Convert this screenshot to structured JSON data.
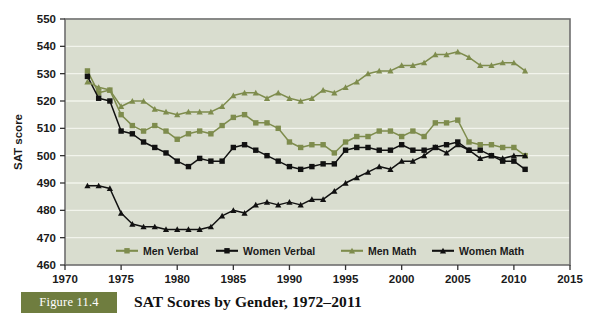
{
  "figure": {
    "badge_label": "Figure 11.4",
    "caption": "SAT Scores by Gender, 1972–2011"
  },
  "colors": {
    "plot_background": "#d9ddcf",
    "plot_border": "#6e6e6e",
    "gridline": "#f2f4ec",
    "men_series": "#7e8c4d",
    "women_series": "#111111",
    "badge_background": "#6f7d3f",
    "badge_text": "#ffffff",
    "text": "#1a1a1a"
  },
  "chart_data": {
    "type": "line",
    "title": "SAT Scores by Gender, 1972–2011",
    "xlabel": "",
    "ylabel": "SAT score",
    "xlim": [
      1970,
      2015
    ],
    "ylim": [
      460,
      550
    ],
    "xticks": [
      1970,
      1975,
      1980,
      1985,
      1990,
      1995,
      2000,
      2005,
      2010,
      2015
    ],
    "yticks": [
      460,
      470,
      480,
      490,
      500,
      510,
      520,
      530,
      540,
      550
    ],
    "grid": true,
    "legend_position": "inside-bottom",
    "x": [
      1972,
      1973,
      1974,
      1975,
      1976,
      1977,
      1978,
      1979,
      1980,
      1981,
      1982,
      1983,
      1984,
      1985,
      1986,
      1987,
      1988,
      1989,
      1990,
      1991,
      1992,
      1993,
      1994,
      1995,
      1996,
      1997,
      1998,
      1999,
      2000,
      2001,
      2002,
      2003,
      2004,
      2005,
      2006,
      2007,
      2008,
      2009,
      2010,
      2011
    ],
    "series": [
      {
        "name": "Men Verbal",
        "color": "#7e8c4d",
        "marker": "square",
        "values": [
          531,
          523,
          524,
          515,
          511,
          509,
          511,
          509,
          506,
          508,
          509,
          508,
          511,
          514,
          515,
          512,
          512,
          510,
          505,
          503,
          504,
          504,
          501,
          505,
          507,
          507,
          509,
          509,
          507,
          509,
          507,
          512,
          512,
          513,
          505,
          504,
          504,
          503,
          503,
          500
        ]
      },
      {
        "name": "Women Verbal",
        "color": "#111111",
        "marker": "square",
        "values": [
          529,
          521,
          520,
          509,
          508,
          505,
          503,
          501,
          498,
          496,
          499,
          498,
          498,
          503,
          504,
          502,
          500,
          498,
          496,
          495,
          496,
          497,
          497,
          502,
          503,
          503,
          502,
          502,
          504,
          502,
          502,
          503,
          504,
          505,
          502,
          502,
          500,
          498,
          498,
          495
        ]
      },
      {
        "name": "Men Math",
        "color": "#7e8c4d",
        "marker": "triangle",
        "values": [
          527,
          525,
          524,
          518,
          520,
          520,
          517,
          516,
          515,
          516,
          516,
          516,
          518,
          522,
          523,
          523,
          521,
          523,
          521,
          520,
          521,
          524,
          523,
          525,
          527,
          530,
          531,
          531,
          533,
          533,
          534,
          537,
          537,
          538,
          536,
          533,
          533,
          534,
          534,
          531
        ]
      },
      {
        "name": "Women Math",
        "color": "#111111",
        "marker": "triangle",
        "values": [
          489,
          489,
          488,
          479,
          475,
          474,
          474,
          473,
          473,
          473,
          473,
          474,
          478,
          480,
          479,
          482,
          483,
          482,
          483,
          482,
          484,
          484,
          487,
          490,
          492,
          494,
          496,
          495,
          498,
          498,
          500,
          503,
          501,
          504,
          502,
          499,
          500,
          499,
          500,
          500
        ]
      }
    ]
  },
  "axis": {
    "y_title": "SAT score"
  },
  "legend": {
    "items": [
      {
        "label": "Men Verbal",
        "color": "#7e8c4d",
        "marker": "square"
      },
      {
        "label": "Women Verbal",
        "color": "#111111",
        "marker": "square"
      },
      {
        "label": "Men Math",
        "color": "#7e8c4d",
        "marker": "triangle"
      },
      {
        "label": "Women Math",
        "color": "#111111",
        "marker": "triangle"
      }
    ]
  }
}
